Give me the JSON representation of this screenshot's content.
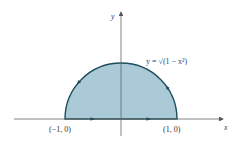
{
  "diagram": {
    "type": "region-plot",
    "curve_equation": "y = √(1 − x²)",
    "x_axis_label": "x",
    "y_axis_label": "y",
    "points": [
      {
        "label": "(−1, 0)",
        "x": -1,
        "y": 0
      },
      {
        "label": "(1, 0)",
        "x": 1,
        "y": 0
      }
    ],
    "region": {
      "fill": "#a9cad6",
      "stroke": "#1f4d5c"
    },
    "orientation": "counterclockwise",
    "x_range": [
      -1.85,
      1.95
    ],
    "y_range": [
      -0.4,
      2.0
    ]
  }
}
